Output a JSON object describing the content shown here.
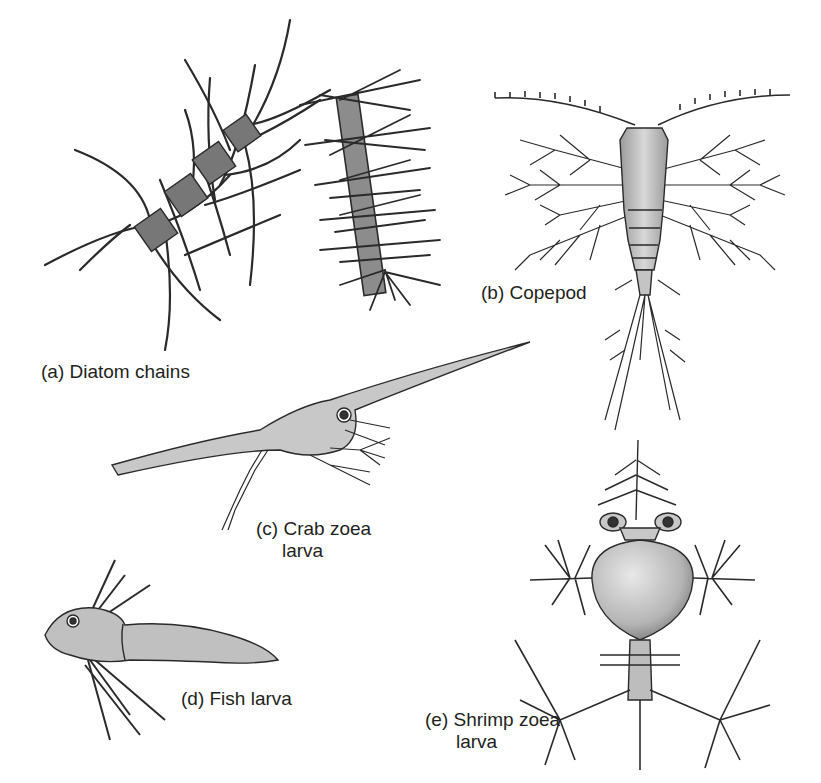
{
  "figure": {
    "background": "#ffffff",
    "ink_color": "#231f20",
    "fill_color": "#b7b7b7",
    "panels": [
      {
        "id": "a",
        "label": "(a) Diatom chains",
        "line2": ""
      },
      {
        "id": "b",
        "label": "(b) Copepod",
        "line2": ""
      },
      {
        "id": "c",
        "label": "(c) Crab zoea",
        "line2": "larva"
      },
      {
        "id": "d",
        "label": "(d) Fish larva",
        "line2": ""
      },
      {
        "id": "e",
        "label": "(e) Shrimp zoea",
        "line2": "larva"
      }
    ]
  }
}
